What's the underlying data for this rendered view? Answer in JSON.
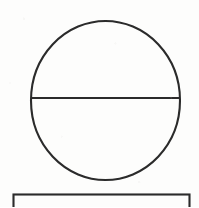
{
  "document": {
    "kind": "line-drawing",
    "title": "Circle bisected by horizontal diameter above a rectangle",
    "background_color": "#fdfdfc",
    "stroke_color": "#2b2b2b",
    "canvas": {
      "width": 199,
      "height": 207
    }
  },
  "figure": {
    "caption": "",
    "shapes": [
      {
        "id": "circle",
        "name": "circle-outline",
        "type": "ellipse",
        "cx": 105.5,
        "cy": 100.5,
        "rx": 74.5,
        "ry": 79.5,
        "stroke": "#2b2b2b",
        "stroke_width": 2.1,
        "fill": "none"
      },
      {
        "id": "diameter",
        "name": "horizontal-diameter-line",
        "type": "line",
        "x1": 31.5,
        "y1": 98.0,
        "x2": 179.5,
        "y2": 98.0,
        "stroke": "#2b2b2b",
        "stroke_width": 2.0
      },
      {
        "id": "rectangle",
        "name": "rectangle-outline",
        "type": "rect",
        "x": 13.5,
        "y": 194.5,
        "width": 176.0,
        "height": 24.0,
        "stroke": "#2b2b2b",
        "stroke_width": 2.1,
        "fill": "none",
        "clipped_at_bottom": true
      }
    ]
  },
  "labels": {
    "circle": "",
    "diameter": "",
    "rectangle": ""
  }
}
